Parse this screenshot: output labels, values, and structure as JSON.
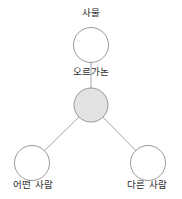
{
  "diagram": {
    "type": "node-link-graph",
    "background_color": "#ffffff",
    "edge_color": "#8c8c8c",
    "node_stroke_color": "#8c8c8c",
    "node_fill_empty": "#ffffff",
    "node_fill_highlight": "#e3e3e3",
    "text_color": "#2b2b2b",
    "nodes": [
      {
        "id": "top",
        "label": "사물",
        "cx": 91,
        "cy": 45,
        "r": 17.5,
        "filled": false,
        "label_position": "above"
      },
      {
        "id": "center",
        "label": "오르가논",
        "cx": 91,
        "cy": 105,
        "r": 17,
        "filled": true,
        "label_position": "above"
      },
      {
        "id": "bottom-left",
        "label": "어떤 사람",
        "cx": 32,
        "cy": 163,
        "r": 17.5,
        "filled": false,
        "label_position": "below"
      },
      {
        "id": "bottom-right",
        "label": "다른 사람",
        "cx": 148,
        "cy": 163,
        "r": 17.5,
        "filled": false,
        "label_position": "below"
      }
    ],
    "edges": [
      {
        "from": "top",
        "to": "center"
      },
      {
        "from": "center",
        "to": "bottom-left"
      },
      {
        "from": "center",
        "to": "bottom-right"
      }
    ]
  }
}
